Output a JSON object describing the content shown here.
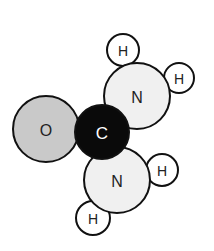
{
  "diagram": {
    "atoms": [
      {
        "id": "O",
        "label": "O",
        "cx": 46,
        "cy": 129,
        "r": 33,
        "fill": "#c9c9c9",
        "text": "#222222",
        "fs": 16
      },
      {
        "id": "N1",
        "label": "N",
        "cx": 137,
        "cy": 96,
        "r": 33,
        "fill": "#f0f0f0",
        "text": "#222222",
        "fs": 16
      },
      {
        "id": "N2",
        "label": "N",
        "cx": 117,
        "cy": 180,
        "r": 33,
        "fill": "#f0f0f0",
        "text": "#222222",
        "fs": 16
      },
      {
        "id": "C",
        "label": "C",
        "cx": 102,
        "cy": 132,
        "r": 27,
        "fill": "#0a0a0a",
        "text": "#ffffff",
        "fs": 17
      },
      {
        "id": "H1",
        "label": "H",
        "cx": 123,
        "cy": 50,
        "r": 16,
        "fill": "#ffffff",
        "text": "#222222",
        "fs": 14
      },
      {
        "id": "H2",
        "label": "H",
        "cx": 179,
        "cy": 78,
        "r": 15,
        "fill": "#ffffff",
        "text": "#222222",
        "fs": 14
      },
      {
        "id": "H3",
        "label": "H",
        "cx": 162,
        "cy": 170,
        "r": 16,
        "fill": "#ffffff",
        "text": "#222222",
        "fs": 14
      },
      {
        "id": "H4",
        "label": "H",
        "cx": 93,
        "cy": 218,
        "r": 17,
        "fill": "#ffffff",
        "text": "#222222",
        "fs": 14
      }
    ],
    "stroke": "#111111"
  }
}
